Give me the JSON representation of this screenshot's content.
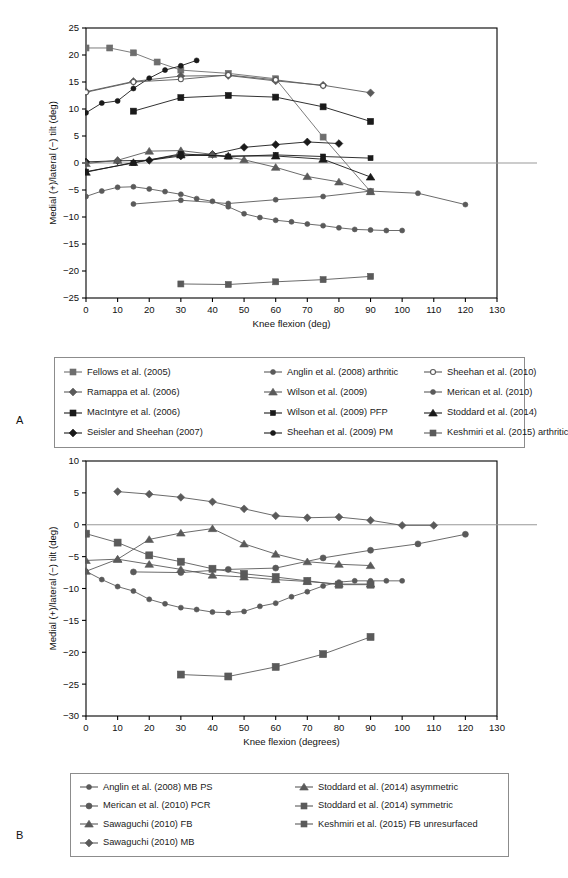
{
  "figure": {
    "panels": [
      {
        "letter": "A"
      },
      {
        "letter": "B"
      }
    ]
  },
  "colors": {
    "axis": "#000000",
    "frame": "#000000",
    "zero_line": "#999999",
    "dark_marker": "#1a1a1a",
    "gray_marker": "#5a5a5a",
    "mid_gray": "#6e6e6e",
    "light_gray": "#8c8c8c",
    "background": "#ffffff"
  },
  "chart_data": [
    {
      "panel": "A",
      "type": "line",
      "title": "",
      "xlabel": "Knee flexion (deg)",
      "ylabel": "Medial (+)/lateral (−) tilt (deg)",
      "xlim": [
        0,
        130
      ],
      "ylim": [
        -25,
        25
      ],
      "xticks": [
        0,
        10,
        20,
        30,
        40,
        50,
        60,
        70,
        80,
        90,
        100,
        110,
        120,
        130
      ],
      "yticks": [
        -25,
        -20,
        -15,
        -10,
        -5,
        0,
        5,
        10,
        15,
        20,
        25
      ],
      "grid": false,
      "zero_line": true,
      "legend_position": "below",
      "legend_columns": 3,
      "series": [
        {
          "name": "Fellows et al. (2005)",
          "marker": "square",
          "color": "#6e6e6e",
          "size": 6,
          "x": [
            0,
            7.5,
            15,
            22.5,
            30,
            45,
            60,
            75,
            90
          ],
          "y": [
            21.3,
            21.3,
            20.4,
            18.7,
            17.2,
            16.6,
            15.6,
            4.8,
            -5.3
          ]
        },
        {
          "name": "Ramappa et al. (2006)",
          "marker": "diamond",
          "color": "#5a5a5a",
          "size": 5,
          "x": [
            0,
            15,
            30,
            45,
            60,
            75,
            90
          ],
          "y": [
            13.2,
            15.1,
            16.1,
            16.2,
            15.2,
            14.4,
            13.0
          ]
        },
        {
          "name": "MacIntyre et al. (2006)",
          "marker": "square",
          "color": "#1a1a1a",
          "size": 6,
          "x": [
            15,
            30,
            45,
            60,
            75,
            90
          ],
          "y": [
            9.6,
            12.1,
            12.5,
            12.2,
            10.4,
            7.7
          ]
        },
        {
          "name": "Seisler and Sheehan (2007)",
          "marker": "diamond",
          "color": "#1a1a1a",
          "size": 5,
          "x": [
            0,
            10,
            20,
            30,
            40,
            50,
            60,
            70,
            80
          ],
          "y": [
            0.2,
            0.4,
            0.5,
            1.3,
            1.6,
            2.9,
            3.4,
            3.9,
            3.6
          ]
        },
        {
          "name": "Anglin et al. (2008) arthritic",
          "marker": "circle",
          "color": "#5a5a5a",
          "size": 5,
          "x": [
            0,
            5,
            10,
            15,
            20,
            25,
            30,
            35,
            40,
            45,
            50,
            55,
            60,
            65,
            70,
            75,
            80,
            85,
            90,
            95,
            100
          ],
          "y": [
            -6.2,
            -5.2,
            -4.5,
            -4.4,
            -4.8,
            -5.3,
            -5.8,
            -6.6,
            -7.1,
            -8.1,
            -9.4,
            -10.1,
            -10.6,
            -10.9,
            -11.3,
            -11.6,
            -12.0,
            -12.3,
            -12.4,
            -12.5,
            -12.5
          ]
        },
        {
          "name": "Wilson et al. (2009)",
          "marker": "triangle",
          "color": "#5a5a5a",
          "size": 6,
          "x": [
            0,
            10,
            20,
            30,
            40,
            50,
            60,
            70,
            80,
            90
          ],
          "y": [
            -0.1,
            0.5,
            2.2,
            2.3,
            1.6,
            0.6,
            -0.8,
            -2.5,
            -3.5,
            -5.3
          ]
        },
        {
          "name": "Wilson et al. (2009) PFP",
          "marker": "square",
          "color": "#1a1a1a",
          "size": 5,
          "x": [
            0,
            15,
            30,
            45,
            60,
            75,
            90
          ],
          "y": [
            -1.6,
            0.0,
            1.7,
            1.2,
            1.5,
            1.2,
            0.9
          ]
        },
        {
          "name": "Sheehan et al. (2009) PM",
          "marker": "circle",
          "color": "#1a1a1a",
          "size": 5,
          "x": [
            0,
            5,
            10,
            15,
            20,
            25,
            30,
            35
          ],
          "y": [
            9.3,
            11.1,
            11.5,
            13.8,
            15.7,
            17.2,
            18.0,
            19.0
          ]
        },
        {
          "name": "Sheehan et al. (2010)",
          "marker": "circle-open",
          "color": "#5a5a5a",
          "size": 5,
          "x": [
            0,
            15,
            30,
            45,
            60,
            75
          ],
          "y": [
            13.1,
            15.0,
            15.5,
            16.3,
            15.4,
            14.3
          ]
        },
        {
          "name": "Merican et al. (2010)",
          "marker": "circle",
          "color": "#5a5a5a",
          "size": 5,
          "x": [
            15,
            30,
            45,
            60,
            75,
            90,
            105,
            120
          ],
          "y": [
            -7.6,
            -6.9,
            -7.5,
            -6.8,
            -6.2,
            -5.2,
            -5.6,
            -7.7
          ]
        },
        {
          "name": "Stoddard et al. (2014)",
          "marker": "triangle",
          "color": "#1a1a1a",
          "size": 6,
          "x": [
            0,
            15,
            30,
            45,
            60,
            75,
            90
          ],
          "y": [
            -1.7,
            0.1,
            1.5,
            1.3,
            1.3,
            0.7,
            -2.6
          ]
        },
        {
          "name": "Keshmiri et al. (2015) arthritic",
          "marker": "square",
          "color": "#5a5a5a",
          "size": 6,
          "x": [
            30,
            45,
            60,
            75,
            90
          ],
          "y": [
            -22.4,
            -22.5,
            -22.0,
            -21.6,
            -21.0
          ]
        }
      ]
    },
    {
      "panel": "B",
      "type": "line",
      "title": "",
      "xlabel": "Knee flexion (degrees)",
      "ylabel": "Medial (+)/lateral (−) tilt (deg)",
      "xlim": [
        0,
        130
      ],
      "ylim": [
        -30,
        10
      ],
      "xticks": [
        0,
        10,
        20,
        30,
        40,
        50,
        60,
        70,
        80,
        90,
        100,
        110,
        120,
        130
      ],
      "yticks": [
        -30,
        -25,
        -20,
        -15,
        -10,
        -5,
        0,
        5,
        10
      ],
      "grid": false,
      "zero_line": true,
      "legend_position": "below",
      "legend_columns": 2,
      "series": [
        {
          "name": "Anglin et al. (2008) MB PS",
          "marker": "circle",
          "color": "#5a5a5a",
          "size": 5,
          "x": [
            0,
            5,
            10,
            15,
            20,
            25,
            30,
            35,
            40,
            45,
            50,
            55,
            60,
            65,
            70,
            75,
            80,
            85,
            90,
            95,
            100
          ],
          "y": [
            -7.3,
            -8.6,
            -9.7,
            -10.4,
            -11.7,
            -12.4,
            -13.0,
            -13.3,
            -13.7,
            -13.8,
            -13.6,
            -12.8,
            -12.3,
            -11.3,
            -10.5,
            -9.6,
            -9.0,
            -8.8,
            -8.8,
            -8.8,
            -8.8
          ]
        },
        {
          "name": "Merican et al. (2010) PCR",
          "marker": "circle",
          "color": "#5a5a5a",
          "size": 6,
          "x": [
            15,
            30,
            45,
            60,
            75,
            90,
            105,
            120
          ],
          "y": [
            -7.4,
            -7.5,
            -7.0,
            -6.8,
            -5.2,
            -4.0,
            -3.0,
            -1.5
          ]
        },
        {
          "name": "Sawaguchi (2010) FB",
          "marker": "triangle",
          "color": "#5a5a5a",
          "size": 6,
          "x": [
            0,
            10,
            20,
            30,
            40,
            50,
            60,
            70,
            80,
            90
          ],
          "y": [
            -5.6,
            -5.4,
            -6.2,
            -7.0,
            -7.9,
            -8.2,
            -8.6,
            -8.9,
            -9.3,
            -9.3
          ]
        },
        {
          "name": "Sawaguchi (2010) MB",
          "marker": "diamond",
          "color": "#5a5a5a",
          "size": 5,
          "x": [
            10,
            20,
            30,
            40,
            50,
            60,
            70,
            80,
            90,
            100,
            110
          ],
          "y": [
            5.2,
            4.8,
            4.3,
            3.6,
            2.5,
            1.4,
            1.1,
            1.2,
            0.7,
            -0.1,
            -0.1
          ]
        },
        {
          "name": "Stoddard et al. (2014) asymmetric",
          "marker": "triangle",
          "color": "#5a5a5a",
          "size": 6,
          "x": [
            0,
            10,
            20,
            30,
            40,
            50,
            60,
            70,
            80,
            90
          ],
          "y": [
            -7.3,
            -5.4,
            -2.3,
            -1.3,
            -0.6,
            -3.0,
            -4.6,
            -5.8,
            -6.2,
            -6.4
          ]
        },
        {
          "name": "Stoddard et al. (2014) symmetric",
          "marker": "square",
          "color": "#5a5a5a",
          "size": 7,
          "x": [
            0,
            10,
            20,
            30,
            40,
            50,
            60,
            70,
            80,
            90
          ],
          "y": [
            -1.4,
            -2.8,
            -4.8,
            -5.8,
            -6.9,
            -7.7,
            -8.2,
            -8.8,
            -9.4,
            -9.4
          ]
        },
        {
          "name": "Keshmiri et al. (2015) FB unresurfaced",
          "marker": "square",
          "color": "#5a5a5a",
          "size": 7,
          "x": [
            30,
            45,
            60,
            75,
            90
          ],
          "y": [
            -23.5,
            -23.8,
            -22.3,
            -20.3,
            -17.6
          ]
        }
      ]
    }
  ]
}
